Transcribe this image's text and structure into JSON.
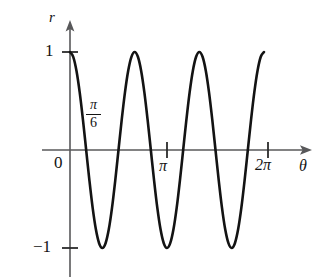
{
  "figure": {
    "background_color": "#ffffff",
    "curve_color": "#131313",
    "axis_color": "#58585a"
  },
  "axes": {
    "y_axis_label": "r",
    "x_axis_label": "θ",
    "origin_label": "0",
    "y_ticks": [
      {
        "value": 1,
        "label": "1"
      },
      {
        "value": -1,
        "label": "−1"
      }
    ],
    "x_ticks": [
      {
        "value": 3.14159,
        "label": "π"
      },
      {
        "value": 6.28319,
        "label": "2π"
      }
    ]
  },
  "annotations": [
    {
      "name": "pi-over-six",
      "numerator": "π",
      "denominator": "6",
      "value": 0.5236
    }
  ],
  "chart_data": {
    "type": "line",
    "title": "",
    "xlabel": "θ",
    "ylabel": "r",
    "xlim": [
      0,
      6.6
    ],
    "ylim": [
      -1.35,
      1.35
    ],
    "grid": false,
    "legend": "none",
    "equation": "r = cos(3θ)",
    "series": [
      {
        "name": "r = cos(3θ)",
        "x": [
          0.0,
          0.1047,
          0.2094,
          0.3142,
          0.4189,
          0.5236,
          0.6283,
          0.733,
          0.8378,
          0.9425,
          1.0472,
          1.1519,
          1.2566,
          1.3614,
          1.4661,
          1.5708,
          1.6755,
          1.7802,
          1.885,
          1.9897,
          2.0944,
          2.1991,
          2.3038,
          2.4086,
          2.5133,
          2.618,
          2.7227,
          2.8274,
          2.9322,
          3.0369,
          3.1416,
          3.2463,
          3.351,
          3.4558,
          3.5605,
          3.6652,
          3.7699,
          3.8746,
          3.9794,
          4.0841,
          4.1888,
          4.2935,
          4.3982,
          4.5029,
          4.6077,
          4.7124,
          4.8171,
          4.9218,
          5.0265,
          5.1313,
          5.236,
          5.3407,
          5.4454,
          5.5501,
          5.6549,
          5.7596,
          5.8643,
          5.969,
          6.0737,
          6.1785,
          6.2832
        ],
        "y": [
          1.0,
          0.951,
          0.809,
          0.588,
          0.309,
          0.0,
          -0.309,
          -0.588,
          -0.809,
          -0.951,
          -1.0,
          -0.951,
          -0.809,
          -0.588,
          -0.309,
          0.0,
          0.309,
          0.588,
          0.809,
          0.951,
          1.0,
          0.951,
          0.809,
          0.588,
          0.309,
          0.0,
          -0.309,
          -0.588,
          -0.809,
          -0.951,
          -1.0,
          -0.951,
          -0.809,
          -0.588,
          -0.309,
          0.0,
          0.309,
          0.588,
          0.809,
          0.951,
          1.0,
          0.951,
          0.809,
          0.588,
          0.309,
          0.0,
          -0.309,
          -0.588,
          -0.809,
          -0.951,
          -1.0,
          -0.951,
          -0.809,
          -0.588,
          -0.309,
          0.0,
          0.309,
          0.588,
          0.809,
          0.951,
          1.0
        ]
      }
    ],
    "key_points": {
      "maxima_theta": [
        0.0,
        2.0944,
        4.1888,
        6.2832
      ],
      "minima_theta": [
        1.0472,
        3.1416,
        5.236
      ],
      "zeros_theta": [
        0.5236,
        1.5708,
        2.618,
        3.6652,
        4.7124,
        5.7596
      ]
    }
  }
}
